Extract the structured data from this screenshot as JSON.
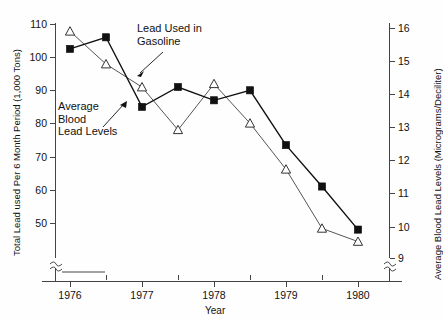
{
  "chart_data": {
    "type": "line",
    "title": "",
    "xlabel": "Year",
    "ylabel": "Total  Lead used Per 6 Month  Period (1,000 Tons)",
    "y2label": "Average Blood Lead Levels (Micrograms/Deciliter)",
    "xlim": [
      1975.75,
      1980.25
    ],
    "ylim": [
      46,
      112
    ],
    "y2lim": [
      8.6,
      16.4
    ],
    "grid": false,
    "legend": "annotations-inline",
    "x_tick_labels": [
      "1976",
      "1977",
      "1978",
      "1979",
      "1980"
    ],
    "x_tick_values": [
      1976,
      1977,
      1978,
      1979,
      1980
    ],
    "x_minor_tick_values": [
      1976.5,
      1977.5,
      1978.5,
      1979.5
    ],
    "y_tick_labels": [
      "110",
      "100",
      "90",
      "80",
      "70",
      "60",
      "50"
    ],
    "y_tick_values": [
      110,
      100,
      90,
      80,
      70,
      60,
      50
    ],
    "y2_tick_labels": [
      "16",
      "15",
      "14",
      "13",
      "12",
      "11",
      "10",
      "9"
    ],
    "y2_tick_values": [
      16,
      15,
      14,
      13,
      12,
      11,
      10,
      9
    ],
    "axis_break": true,
    "x": [
      1976.0,
      1976.5,
      1977.0,
      1977.5,
      1978.0,
      1978.5,
      1979.0,
      1979.5,
      1980.0
    ],
    "series": [
      {
        "name": "Lead Used in Gasoline",
        "marker": "square-filled",
        "axis": "left",
        "units": "1,000 Tons",
        "values": [
          102.5,
          106.0,
          85.0,
          91.0,
          87.0,
          90.0,
          73.5,
          61.0,
          48.0
        ]
      },
      {
        "name": "Average Blood Lead Levels",
        "marker": "triangle-open",
        "axis": "right",
        "units": "Micrograms/Deciliter",
        "values": [
          15.9,
          14.9,
          14.2,
          12.9,
          14.3,
          13.1,
          11.7,
          9.9,
          9.5
        ]
      }
    ],
    "annotations": [
      {
        "id": "gasoline-label",
        "text_lines": [
          "Lead Used in",
          "Gasoline"
        ],
        "points_to_series": "Lead Used in Gasoline"
      },
      {
        "id": "blood-label",
        "text_lines": [
          "Average",
          "Blood",
          "Lead Levels"
        ],
        "points_to_series": "Average Blood Lead Levels"
      }
    ]
  },
  "axes": {
    "left_title": "Total  Lead used Per 6 Month  Period (1,000 Tons)",
    "right_title": "Average Blood Lead Levels (Micrograms/Deciliter)",
    "bottom_title": "Year"
  },
  "annotations": {
    "gasoline": {
      "line1": "Lead Used in",
      "line2": "Gasoline"
    },
    "blood": {
      "line1": "Average",
      "line2": "Blood",
      "line3": "Lead Levels"
    }
  },
  "colors": {
    "axis": "#444444",
    "gasoline_series": "#111111",
    "blood_series": "#333333",
    "background": "#fefefe"
  }
}
